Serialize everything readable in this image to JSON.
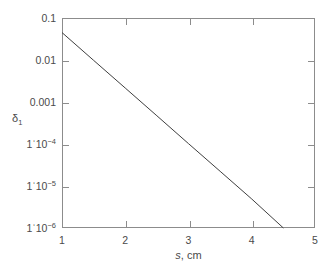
{
  "chart_data": {
    "type": "line",
    "title": "",
    "xlabel": "s, cm",
    "ylabel": "δ₁",
    "xlabel_var": "s",
    "xlabel_rest": ", cm",
    "ylabel_base": "δ",
    "ylabel_sub": "1",
    "yscale": "log",
    "xscale": "linear",
    "xlim": [
      1,
      5
    ],
    "ylim": [
      1e-06,
      0.1
    ],
    "grid": false,
    "legend": null,
    "x_ticks": [
      {
        "value": 1,
        "label": "1"
      },
      {
        "value": 2,
        "label": "2"
      },
      {
        "value": 3,
        "label": "3"
      },
      {
        "value": 4,
        "label": "4"
      },
      {
        "value": 5,
        "label": "5"
      }
    ],
    "y_ticks": [
      {
        "value": 0.1,
        "label": "0.1",
        "mantissa": "",
        "exponent": ""
      },
      {
        "value": 0.01,
        "label": "0.01",
        "mantissa": "",
        "exponent": ""
      },
      {
        "value": 0.001,
        "label": "0.001",
        "mantissa": "",
        "exponent": ""
      },
      {
        "value": 0.0001,
        "label": "1·10⁻⁴",
        "mantissa": "1ˈ10",
        "exponent": "−4"
      },
      {
        "value": 1e-05,
        "label": "1·10⁻⁵",
        "mantissa": "1ˈ10",
        "exponent": "−5"
      },
      {
        "value": 1e-06,
        "label": "1·10⁻⁶",
        "mantissa": "1ˈ10",
        "exponent": "−6"
      }
    ],
    "series": [
      {
        "name": "delta_1",
        "x": [
          1.0,
          4.5
        ],
        "y": [
          0.045,
          1e-06
        ],
        "points": [
          {
            "x": 1.0,
            "y": 0.045
          },
          {
            "x": 1.5,
            "y": 0.0098
          },
          {
            "x": 2.0,
            "y": 0.00215
          },
          {
            "x": 2.5,
            "y": 0.00047
          },
          {
            "x": 3.0,
            "y": 0.000102
          },
          {
            "x": 3.5,
            "y": 2.24e-05
          },
          {
            "x": 4.0,
            "y": 4.9e-06
          },
          {
            "x": 4.5,
            "y": 1e-06
          }
        ]
      }
    ],
    "colors": {
      "line": "#3f3f3f",
      "axis": "#8c8c8c",
      "text": "#4a4a4a",
      "background": "#ffffff"
    }
  }
}
